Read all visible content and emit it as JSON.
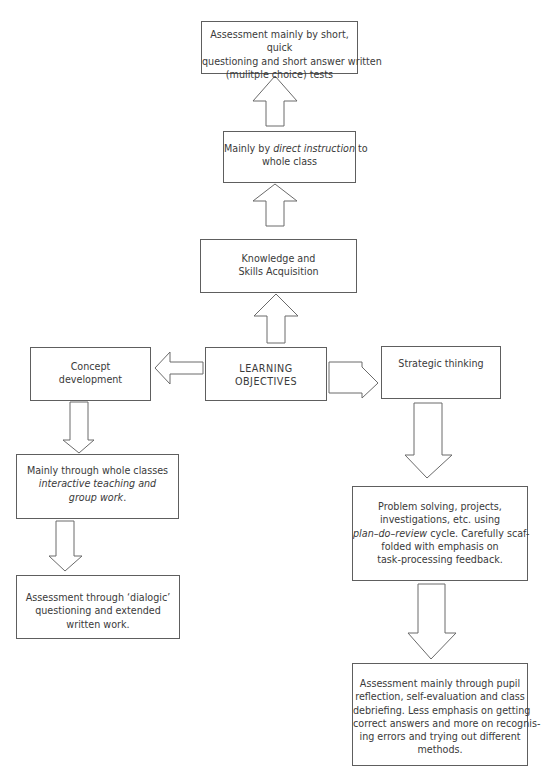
{
  "diagram": {
    "center": {
      "lines": [
        "LEARNING",
        "OBJECTIVES"
      ]
    },
    "branches": {
      "up": {
        "node": {
          "lines": [
            "Knowledge and",
            "Skills Acquisition"
          ]
        },
        "method": {
          "line1_pre": "Mainly by ",
          "line1_em": "direct instruction",
          "line1_post": " to",
          "line2": "whole class"
        },
        "assessment": {
          "lines": [
            "Assessment mainly by short, quick",
            "questioning and short answer written",
            "(mulitple choice) tests"
          ]
        }
      },
      "left": {
        "node": {
          "lines": [
            "Concept",
            "development"
          ]
        },
        "method": {
          "line1": "Mainly through whole classes",
          "line2_em": "interactive teaching and",
          "line3_em": "group work",
          "line3_post": "."
        },
        "assessment": {
          "lines": [
            "Assessment through ‘dialogic’",
            "questioning and extended",
            "written work."
          ]
        }
      },
      "right": {
        "node": {
          "lines": [
            "Strategic thinking"
          ]
        },
        "method": {
          "line1": "Problem solving, projects,",
          "line2": "investigations, etc. using",
          "line3_em": "plan–do–review",
          "line3_post": " cycle. Carefully scaf-",
          "line4": "folded with emphasis on",
          "line5": "task-processing feedback."
        },
        "assessment": {
          "lines": [
            "Assessment mainly through pupil",
            "reflection, self-evaluation and class",
            "debriefing. Less emphasis on getting",
            "correct answers and more on recognis-",
            "ing errors and trying out different",
            "methods."
          ]
        }
      }
    },
    "colors": {
      "stroke": "#5e5e5e",
      "text": "#3a3a3a",
      "background": "#ffffff"
    }
  }
}
